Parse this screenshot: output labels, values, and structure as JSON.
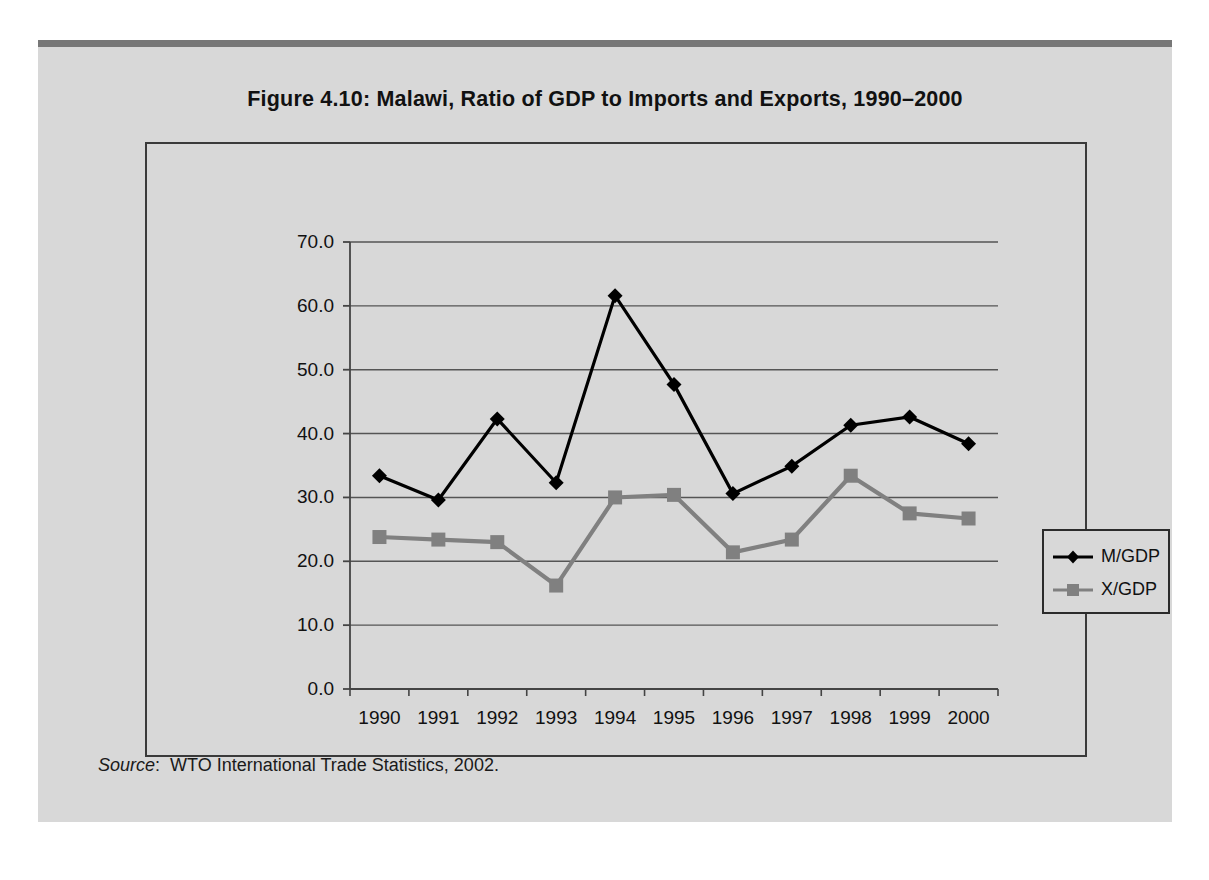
{
  "figure": {
    "title": "Figure 4.10:  Malawi, Ratio of GDP to Imports and Exports, 1990–2000",
    "source_keyword": "Source",
    "source_separator": ":",
    "source_text": "WTO International Trade Statistics, 2002."
  },
  "colors": {
    "page_background": "#ffffff",
    "panel_background": "#d8d8d8",
    "panel_top_rule": "#777777",
    "chart_border": "#3a3a3a",
    "gridline": "#555555",
    "axis": "#444444",
    "series_m_gdp": "#000000",
    "series_x_gdp": "#808080",
    "text": "#111111"
  },
  "chart_data": {
    "type": "line",
    "title": "Figure 4.10:  Malawi, Ratio of GDP to Imports and Exports, 1990–2000",
    "xlabel": "",
    "ylabel": "",
    "x": [
      1990,
      1991,
      1992,
      1993,
      1994,
      1995,
      1996,
      1997,
      1998,
      1999,
      2000
    ],
    "categories": [
      "1990",
      "1991",
      "1992",
      "1993",
      "1994",
      "1995",
      "1996",
      "1997",
      "1998",
      "1999",
      "2000"
    ],
    "series": [
      {
        "name": "M/GDP",
        "color": "#000000",
        "marker": "diamond",
        "values": [
          33.4,
          29.6,
          42.3,
          32.3,
          61.6,
          47.7,
          30.6,
          34.9,
          41.3,
          42.6,
          38.4
        ]
      },
      {
        "name": "X/GDP",
        "color": "#808080",
        "marker": "square",
        "values": [
          23.8,
          23.4,
          23.0,
          16.2,
          30.0,
          30.4,
          21.4,
          23.4,
          33.4,
          27.5,
          26.7
        ]
      }
    ],
    "ylim": [
      0.0,
      70.0
    ],
    "yticks": [
      0.0,
      10.0,
      20.0,
      30.0,
      40.0,
      50.0,
      60.0,
      70.0
    ],
    "ytick_labels": [
      "0.0",
      "10.0",
      "20.0",
      "30.0",
      "40.0",
      "50.0",
      "60.0",
      "70.0"
    ],
    "grid": true,
    "grid_axis": "y",
    "legend_position": "right-outside",
    "legend_entries": [
      "M/GDP",
      "X/GDP"
    ]
  }
}
